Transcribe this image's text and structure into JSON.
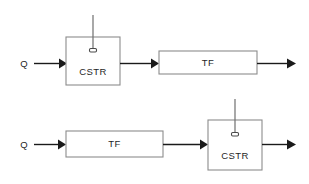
{
  "figure": {
    "background_color": "#ffffff",
    "line_color": "#1a1a1a",
    "box_stroke_color": "#8c8c8c",
    "text_color": "#1f1f1f"
  },
  "rows": [
    {
      "id": "top-row",
      "order_description": "Q enters CSTR first, then TF",
      "inlet_label": "Q",
      "blocks": [
        {
          "id": "cstr",
          "label": "CSTR",
          "has_stirrer": true
        },
        {
          "id": "tf",
          "label": "TF",
          "has_stirrer": false
        }
      ]
    },
    {
      "id": "bottom-row",
      "order_description": "Q enters TF first, then CSTR",
      "inlet_label": "Q",
      "blocks": [
        {
          "id": "tf",
          "label": "TF",
          "has_stirrer": false
        },
        {
          "id": "cstr",
          "label": "CSTR",
          "has_stirrer": true
        }
      ]
    }
  ]
}
